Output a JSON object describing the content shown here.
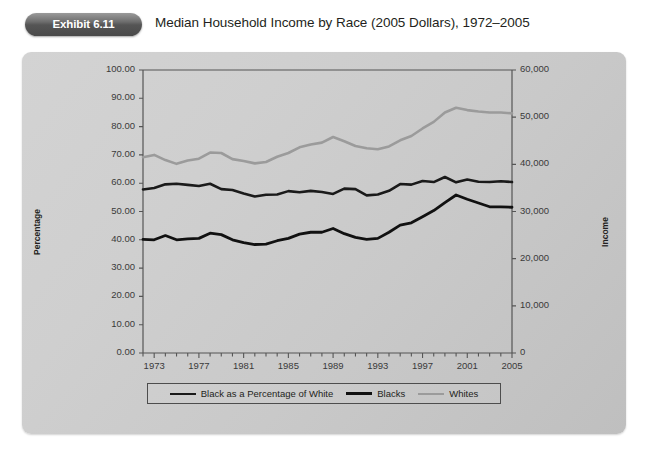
{
  "header": {
    "badge_label": "Exhibit 6.11",
    "title": "Median Household Income by Race (2005 Dollars), 1972–2005"
  },
  "colors": {
    "panel_background": "#cccccc",
    "badge": "#555555",
    "axis": "#555555",
    "series_percentage": "#1a1a1a",
    "series_blacks": "#111111",
    "series_whites": "#9b9b9b",
    "text": "#231f20"
  },
  "chart_data": {
    "type": "line",
    "title": "Median Household Income by Race (2005 Dollars), 1972–2005",
    "xlabel": "",
    "ylabel": "Percentage",
    "y2label": "Income",
    "ylim": [
      0,
      100
    ],
    "y2lim": [
      0,
      60000
    ],
    "grid": false,
    "legend_position": "bottom",
    "y_ticks": [
      "0.00",
      "10.00",
      "20.00",
      "30.00",
      "40.00",
      "50.00",
      "60.00",
      "70.00",
      "80.00",
      "90.00",
      "100.00"
    ],
    "y_tick_values": [
      0,
      10,
      20,
      30,
      40,
      50,
      60,
      70,
      80,
      90,
      100
    ],
    "y2_ticks": [
      "0",
      "10,000",
      "20,000",
      "30,000",
      "40,000",
      "50,000",
      "60,000"
    ],
    "y2_tick_values": [
      0,
      10000,
      20000,
      30000,
      40000,
      50000,
      60000
    ],
    "x": [
      1972,
      1973,
      1974,
      1975,
      1976,
      1977,
      1978,
      1979,
      1980,
      1981,
      1982,
      1983,
      1984,
      1985,
      1986,
      1987,
      1988,
      1989,
      1990,
      1991,
      1992,
      1993,
      1994,
      1995,
      1996,
      1997,
      1998,
      1999,
      2000,
      2001,
      2002,
      2003,
      2004,
      2005
    ],
    "x_tick_labels": [
      "1973",
      "1977",
      "1981",
      "1985",
      "1989",
      "1993",
      "1997",
      "2001",
      "2005"
    ],
    "x_tick_values": [
      1973,
      1977,
      1981,
      1985,
      1989,
      1993,
      1997,
      2001,
      2005
    ],
    "series": [
      {
        "name": "Black as a Percentage of White",
        "axis": "left",
        "color": "#1a1a1a",
        "width": 2.6,
        "values": [
          57.8,
          58.3,
          59.6,
          59.8,
          59.4,
          59.0,
          59.8,
          57.9,
          57.6,
          56.4,
          55.3,
          55.9,
          56.0,
          57.2,
          56.8,
          57.3,
          56.9,
          56.2,
          58.1,
          57.9,
          55.7,
          56.0,
          57.3,
          59.7,
          59.5,
          60.8,
          60.4,
          62.2,
          60.3,
          61.3,
          60.5,
          60.4,
          60.7,
          60.4
        ]
      },
      {
        "name": "Blacks",
        "axis": "right",
        "color": "#111111",
        "width": 2.8,
        "values": [
          24100,
          24000,
          24900,
          24000,
          24200,
          24300,
          25400,
          25100,
          24000,
          23400,
          23000,
          23100,
          23800,
          24300,
          25200,
          25600,
          25600,
          26400,
          25300,
          24500,
          24100,
          24300,
          25600,
          27100,
          27600,
          28900,
          30200,
          31900,
          33500,
          32600,
          31800,
          31000,
          31000,
          30900
        ]
      },
      {
        "name": "Whites",
        "axis": "right",
        "color": "#9b9b9b",
        "width": 2.6,
        "values": [
          41500,
          42000,
          40900,
          40100,
          40800,
          41200,
          42500,
          42400,
          41100,
          40700,
          40200,
          40500,
          41600,
          42400,
          43600,
          44200,
          44600,
          45800,
          44900,
          43900,
          43400,
          43200,
          43800,
          45100,
          46000,
          47600,
          49000,
          51000,
          52000,
          51500,
          51200,
          51000,
          51000,
          50800
        ]
      }
    ]
  },
  "legend": {
    "items": [
      {
        "label": "Black as a Percentage of White",
        "color": "#1a1a1a",
        "width": 2.6
      },
      {
        "label": "Blacks",
        "color": "#111111",
        "width": 3.2
      },
      {
        "label": "Whites",
        "color": "#9b9b9b",
        "width": 2.6
      }
    ]
  }
}
